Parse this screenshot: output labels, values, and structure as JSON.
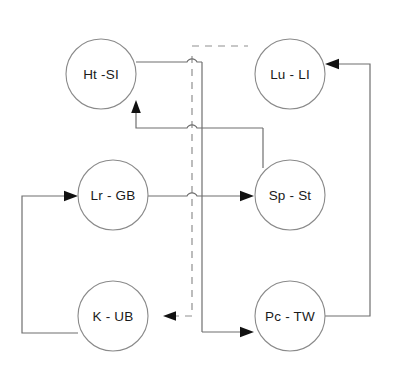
{
  "diagram": {
    "canvas": {
      "width": 393,
      "height": 388,
      "background": "#ffffff"
    },
    "style": {
      "node_stroke": "#8a8a8a",
      "node_fill": "#ffffff",
      "edge_solid_color": "#6f6f6f",
      "edge_dashed_color": "#8f8f8f",
      "arrow_color": "#111111",
      "label_color": "#1a1a1a",
      "node_radius": 35
    },
    "nodes": [
      {
        "id": "ht-si",
        "label": "Ht -SI",
        "cx": 101,
        "cy": 74,
        "r": 35,
        "row": "top",
        "column": "left"
      },
      {
        "id": "lu-li",
        "label": "Lu - LI",
        "cx": 290,
        "cy": 74,
        "r": 35,
        "row": "top",
        "column": "right"
      },
      {
        "id": "lr-gb",
        "label": "Lr - GB",
        "cx": 113,
        "cy": 195,
        "r": 35,
        "row": "middle",
        "column": "left"
      },
      {
        "id": "sp-st",
        "label": "Sp - St",
        "cx": 290,
        "cy": 195,
        "r": 35,
        "row": "middle",
        "column": "right"
      },
      {
        "id": "k-ub",
        "label": "K - UB",
        "cx": 113,
        "cy": 316,
        "r": 35,
        "row": "bottom",
        "column": "left"
      },
      {
        "id": "pc-tw",
        "label": "Pc - TW",
        "cx": 290,
        "cy": 316,
        "r": 35,
        "row": "bottom",
        "column": "right"
      }
    ],
    "edges": [
      {
        "id": "edge-ht-si-to-bus",
        "from": "ht-si",
        "to": "vertical-bus",
        "style": "solid",
        "arrow": false
      },
      {
        "id": "edge-bus-to-lu-li",
        "from": "vertical-bus",
        "to": "lu-li",
        "style": "dashed",
        "arrow": false
      },
      {
        "id": "edge-sp-st-to-ht-si",
        "from": "sp-st",
        "to": "ht-si",
        "style": "solid",
        "arrow": true
      },
      {
        "id": "edge-lr-gb-to-sp-st",
        "from": "lr-gb",
        "to": "sp-st",
        "style": "solid",
        "arrow": true
      },
      {
        "id": "edge-bus-to-k-ub",
        "from": "vertical-bus",
        "to": "k-ub",
        "style": "dashed",
        "arrow": true
      },
      {
        "id": "edge-bus-to-pc-tw",
        "from": "vertical-bus",
        "to": "pc-tw",
        "style": "solid",
        "arrow": true
      },
      {
        "id": "edge-pc-tw-to-lu-li",
        "from": "pc-tw",
        "to": "lu-li",
        "style": "solid",
        "arrow": true,
        "route": "right-outer-loop"
      },
      {
        "id": "edge-k-ub-to-lr-gb",
        "from": "k-ub",
        "to": "lr-gb",
        "style": "solid",
        "arrow": true,
        "route": "left-outer-loop"
      }
    ],
    "bus": {
      "dashed_line": {
        "x": 192,
        "y1": 46,
        "y2": 318
      },
      "solid_line": {
        "x": 202,
        "y1": 62,
        "y2": 334
      },
      "hops": [
        {
          "id": "hop-top",
          "x": 192,
          "y": 62
        },
        {
          "id": "hop-middle",
          "x": 192,
          "y": 128
        },
        {
          "id": "hop-lower",
          "x": 192,
          "y": 196
        }
      ]
    }
  }
}
